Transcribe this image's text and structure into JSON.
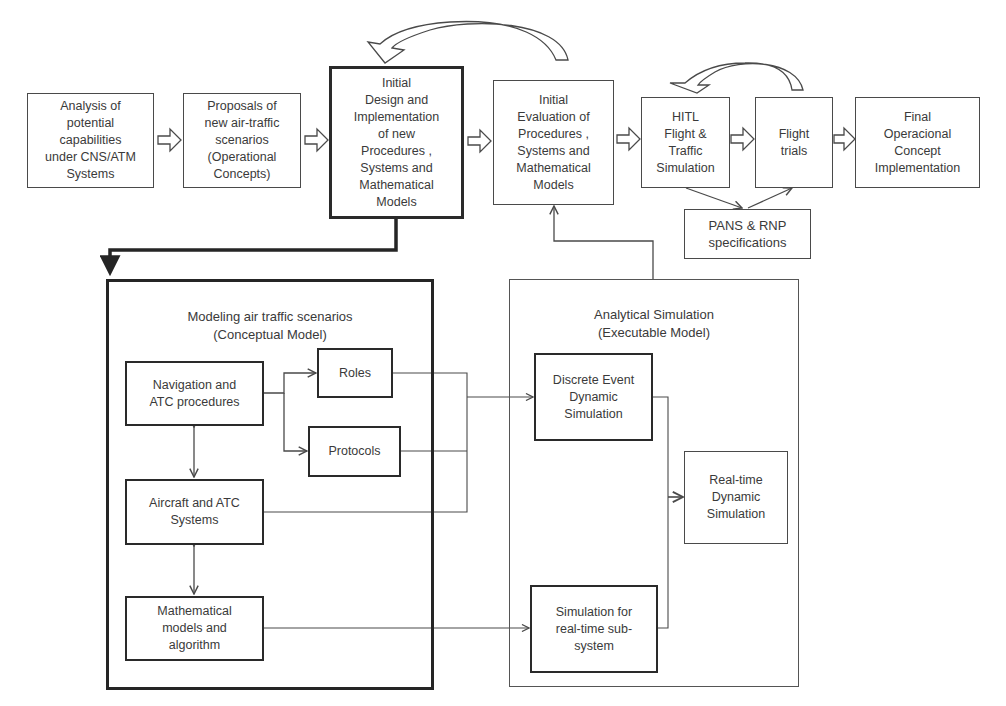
{
  "diagram": {
    "top_flow": [
      {
        "id": "analysis",
        "label": "Analysis of\npotential\ncapabilities\nunder CNS/ATM\nSystems"
      },
      {
        "id": "proposals",
        "label": "Proposals of\nnew air-traffic\nscenarios\n(Operational\nConcepts)"
      },
      {
        "id": "initial_design",
        "label": "Initial\nDesign and\nImplementation\nof new\nProcedures ,\nSystems and\nMathematical\nModels"
      },
      {
        "id": "initial_evaluation",
        "label": "Initial\nEvaluation of\nProcedures ,\nSystems and\nMathematical\nModels"
      },
      {
        "id": "hitl",
        "label": "HITL\nFlight &\nTraffic\nSimulation"
      },
      {
        "id": "flight_trials",
        "label": "Flight\ntrials"
      },
      {
        "id": "final",
        "label": "Final\nOperacional\nConcept\nImplementation"
      }
    ],
    "pans": {
      "label": "PANS & RNP\nspecifications"
    },
    "conceptual": {
      "title": "Modeling air traffic scenarios\n(Conceptual Model)",
      "nav_atc": "Navigation and\nATC procedures",
      "roles": "Roles",
      "protocols": "Protocols",
      "aircraft": "Aircraft and ATC\nSystems",
      "math": "Mathematical\nmodels and\nalgorithm"
    },
    "analytical": {
      "title": "Analytical Simulation\n(Executable  Model)",
      "discrete": "Discrete Event\nDynamic\nSimulation",
      "realtime": "Real-time\nDynamic\nSimulation",
      "subsystem": "Simulation for\nreal-time sub-\nsystem"
    },
    "colors": {
      "line": "#4a4a4a",
      "thick_line": "#252525",
      "text": "#3a3a3a"
    }
  }
}
